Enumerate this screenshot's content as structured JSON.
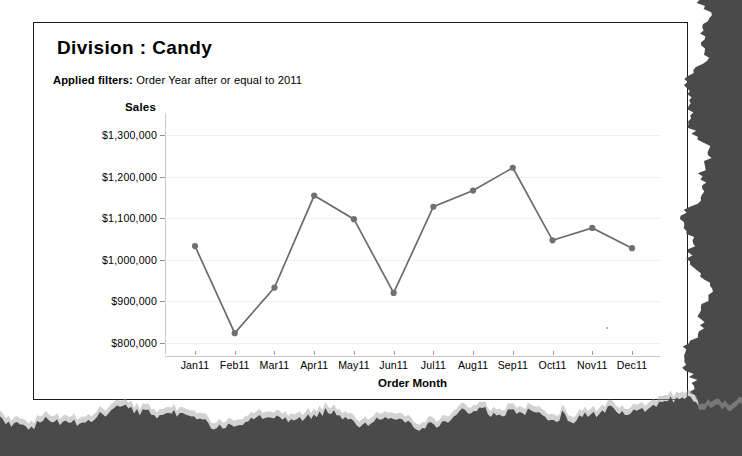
{
  "report": {
    "title": "Division :  Candy",
    "filters_label": "Applied filters:",
    "filters_value": " Order Year after or equal to 2011"
  },
  "chart_data": {
    "type": "line",
    "title": "Division :  Candy",
    "xlabel": "Order Month",
    "ylabel": "Sales",
    "categories": [
      "Jan11",
      "Feb11",
      "Mar11",
      "Apr11",
      "May11",
      "Jun11",
      "Jul11",
      "Aug11",
      "Sep11",
      "Oct11",
      "Nov11",
      "Dec11"
    ],
    "values": [
      1033000,
      823000,
      933000,
      1155000,
      1098000,
      920000,
      1128000,
      1167000,
      1222000,
      1047000,
      1077000,
      1028000
    ],
    "ytick_labels": [
      "$1,300,000",
      "$1,200,000",
      "$1,100,000",
      "$1,000,000",
      "$900,000",
      "$800,000"
    ],
    "ytick_values": [
      1300000,
      1200000,
      1100000,
      1000000,
      900000,
      800000
    ],
    "ylim": [
      780000,
      1330000
    ],
    "grid": true,
    "legend": "none",
    "line_color": "#6b6b6b",
    "marker_color": "#707070"
  }
}
